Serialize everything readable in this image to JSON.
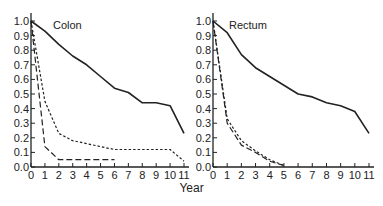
{
  "figure": {
    "shared_xlabel": "Year",
    "ink_color": "#222222",
    "background": "#ffffff"
  },
  "chart_data": [
    {
      "type": "line",
      "title": "Colon",
      "xlabel": "Year",
      "ylabel": "",
      "xlim": [
        0,
        11
      ],
      "ylim": [
        0.0,
        1.0
      ],
      "x_ticks": [
        "0",
        "1",
        "2",
        "3",
        "4",
        "5",
        "6",
        "7",
        "8",
        "9",
        "10",
        "11"
      ],
      "y_ticks": [
        "0.0",
        "0.1",
        "0.2",
        "0.3",
        "0.4",
        "0.5",
        "0.6",
        "0.7",
        "0.8",
        "0.9",
        "1.0"
      ],
      "grid": false,
      "legend": null,
      "series": [
        {
          "name": "solid",
          "style": "solid",
          "x": [
            0,
            1,
            2,
            3,
            4,
            5,
            6,
            7,
            8,
            9,
            10,
            11
          ],
          "values": [
            1.0,
            0.93,
            0.84,
            0.76,
            0.7,
            0.62,
            0.54,
            0.51,
            0.44,
            0.44,
            0.42,
            0.23
          ]
        },
        {
          "name": "short-dash",
          "style": "short-dash",
          "x": [
            0,
            1,
            2,
            3,
            4,
            5,
            6,
            7,
            8,
            9,
            10,
            11
          ],
          "values": [
            1.0,
            0.45,
            0.23,
            0.18,
            0.16,
            0.14,
            0.12,
            0.12,
            0.12,
            0.12,
            0.12,
            0.04
          ]
        },
        {
          "name": "long-dash",
          "style": "long-dash",
          "x": [
            0,
            1,
            2,
            3,
            4,
            5,
            6
          ],
          "values": [
            1.0,
            0.14,
            0.05,
            0.05,
            0.05,
            0.05,
            0.05
          ]
        }
      ]
    },
    {
      "type": "line",
      "title": "Rectum",
      "xlabel": "Year",
      "ylabel": "",
      "xlim": [
        0,
        11
      ],
      "ylim": [
        0.0,
        1.0
      ],
      "x_ticks": [
        "0",
        "1",
        "2",
        "3",
        "4",
        "5",
        "6",
        "7",
        "8",
        "9",
        "10",
        "11"
      ],
      "y_ticks": [
        "0.0",
        "0.1",
        "0.2",
        "0.3",
        "0.4",
        "0.5",
        "0.6",
        "0.7",
        "0.8",
        "0.9",
        "1.0"
      ],
      "grid": false,
      "legend": null,
      "series": [
        {
          "name": "solid",
          "style": "solid",
          "x": [
            0,
            1,
            2,
            3,
            4,
            5,
            6,
            7,
            8,
            9,
            10,
            11
          ],
          "values": [
            1.0,
            0.92,
            0.77,
            0.68,
            0.62,
            0.56,
            0.5,
            0.48,
            0.44,
            0.42,
            0.38,
            0.23
          ]
        },
        {
          "name": "short-dash",
          "style": "short-dash",
          "x": [
            0,
            1,
            2,
            3,
            4,
            5
          ],
          "values": [
            1.0,
            0.33,
            0.18,
            0.11,
            0.05,
            0.01
          ]
        },
        {
          "name": "long-dash",
          "style": "long-dash",
          "x": [
            0,
            1,
            2,
            3,
            4,
            5
          ],
          "values": [
            1.0,
            0.3,
            0.15,
            0.1,
            0.04,
            0.01
          ]
        }
      ]
    }
  ]
}
